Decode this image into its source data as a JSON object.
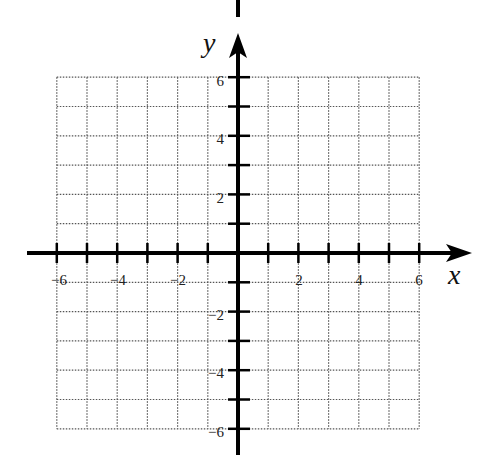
{
  "chart_data": {
    "type": "coordinate-grid",
    "title": "",
    "xlabel": "x",
    "ylabel": "y",
    "xlim": [
      -6,
      6
    ],
    "ylim": [
      -6,
      6
    ],
    "grid": true,
    "grid_style": "dotted",
    "grid_step": 1,
    "x_tick_labels": [
      "-6",
      "-4",
      "-2",
      "2",
      "4",
      "6"
    ],
    "x_tick_values": [
      -6,
      -4,
      -2,
      2,
      4,
      6
    ],
    "y_tick_labels": [
      "6",
      "4",
      "2",
      "-2",
      "-4",
      "-6"
    ],
    "y_tick_values": [
      6,
      4,
      2,
      -2,
      -4,
      -6
    ],
    "data": []
  },
  "labels": {
    "x_axis": "x",
    "y_axis": "y",
    "x_ticks": {
      "n6": "−6",
      "n4": "−4",
      "n2": "−2",
      "p2": "2",
      "p4": "4",
      "p6": "6"
    },
    "y_ticks": {
      "p6": "6",
      "p4": "4",
      "p2": "2",
      "n2": "−2",
      "n4": "−4",
      "n6": "−6"
    }
  },
  "colors": {
    "axis": "#000000",
    "grid": "#555555",
    "background": "#ffffff"
  }
}
